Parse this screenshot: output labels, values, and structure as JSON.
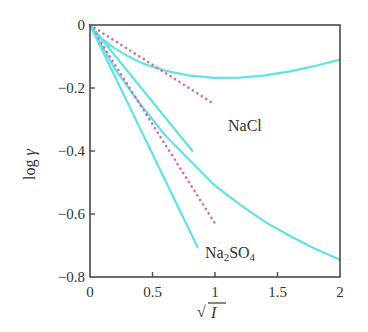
{
  "chart_data": {
    "type": "line",
    "title": "",
    "xlabel": "√I",
    "ylabel": "log γ",
    "xlim": [
      0,
      2
    ],
    "ylim": [
      -0.8,
      0
    ],
    "xticks": [
      0,
      0.5,
      1,
      1.5,
      2
    ],
    "xtick_labels": [
      "0",
      "0.5",
      "1",
      "1.5",
      "2"
    ],
    "yticks": [
      0,
      -0.2,
      -0.4,
      -0.6,
      -0.8
    ],
    "ytick_labels": [
      "0",
      "−0.2",
      "−0.4",
      "−0.6",
      "−0.8"
    ],
    "grid": false,
    "legend": null,
    "annotations": [
      {
        "text": "NaCl",
        "x": 1.24,
        "y": -0.33
      },
      {
        "text": "Na2SO4",
        "x": 0.92,
        "y": -0.735
      }
    ],
    "series": [
      {
        "name": "NaCl experimental",
        "style": "solid",
        "color": "#5fe3e8",
        "x": [
          0,
          0.1,
          0.2,
          0.3,
          0.4,
          0.5,
          0.6,
          0.8,
          1.0,
          1.2,
          1.4,
          1.6,
          1.8,
          2.0
        ],
        "y": [
          0,
          -0.045,
          -0.075,
          -0.098,
          -0.118,
          -0.133,
          -0.145,
          -0.161,
          -0.168,
          -0.167,
          -0.16,
          -0.147,
          -0.13,
          -0.11
        ]
      },
      {
        "name": "NaCl limiting law",
        "style": "dashed",
        "color": "#e0679a",
        "x": [
          0,
          0.97
        ],
        "y": [
          0,
          -0.245
        ]
      },
      {
        "name": "NaCl extended",
        "style": "solid",
        "color": "#5fe3e8",
        "x": [
          0,
          0.82
        ],
        "y": [
          0,
          -0.4
        ]
      },
      {
        "name": "Na2SO4 experimental",
        "style": "solid",
        "color": "#5fe3e8",
        "x": [
          0,
          0.2,
          0.4,
          0.6,
          0.8,
          1.0,
          1.2,
          1.4,
          1.6,
          1.8,
          2.0
        ],
        "y": [
          0,
          -0.14,
          -0.25,
          -0.35,
          -0.43,
          -0.51,
          -0.57,
          -0.625,
          -0.67,
          -0.71,
          -0.745
        ]
      },
      {
        "name": "Na2SO4 limiting law",
        "style": "dashed",
        "color": "#e0679a",
        "x": [
          0,
          1.0
        ],
        "y": [
          0,
          -0.63
        ]
      },
      {
        "name": "Na2SO4 extended",
        "style": "solid",
        "color": "#5fe3e8",
        "x": [
          0,
          0.86
        ],
        "y": [
          0,
          -0.705
        ]
      }
    ]
  },
  "layout": {
    "plot": {
      "left": 90,
      "top": 25,
      "right": 340,
      "bottom": 277
    }
  },
  "labels": {
    "nacl": "NaCl",
    "na2so4_main": "Na",
    "na2so4_sub1": "2",
    "na2so4_mid": "SO",
    "na2so4_sub2": "4",
    "ylabel_log": "log",
    "ylabel_gamma": "γ",
    "xlabel_root": "√",
    "xlabel_var": "I"
  }
}
